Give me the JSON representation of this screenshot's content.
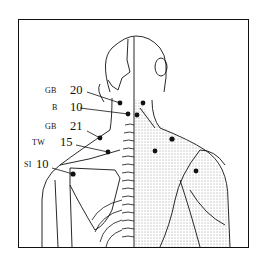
{
  "figure": {
    "colors": {
      "ink": "#111111",
      "background": "#ffffff"
    }
  },
  "points": [
    {
      "meridian": "GB",
      "number": "20"
    },
    {
      "meridian": "B",
      "number": "10"
    },
    {
      "meridian": "GB",
      "number": "21"
    },
    {
      "meridian": "TW",
      "number": "15"
    },
    {
      "meridian": "SI",
      "number": "10"
    }
  ]
}
